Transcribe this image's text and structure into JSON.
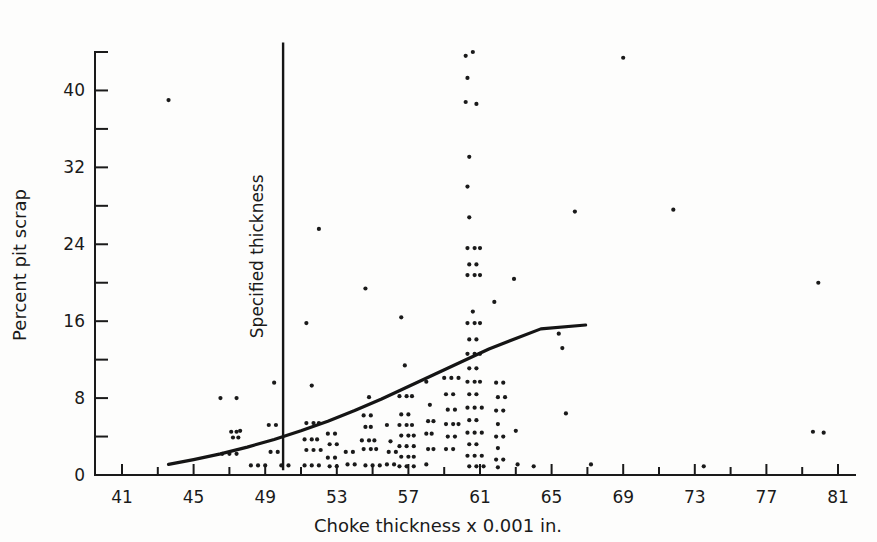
{
  "chart_data": {
    "type": "scatter",
    "title": "",
    "xlabel": "Choke thickness x 0.001 in.",
    "ylabel": "Percent pit scrap",
    "xlim": [
      40,
      82
    ],
    "ylim": [
      0,
      44
    ],
    "grid": false,
    "legend": null,
    "x_ticks_major": [
      41,
      45,
      49,
      53,
      57,
      61,
      65,
      69,
      73,
      77,
      81
    ],
    "x_ticks_minor": [
      43,
      47,
      51,
      55,
      59,
      63,
      67,
      71,
      75,
      79
    ],
    "y_ticks_major": [
      0,
      8,
      16,
      24,
      32,
      40
    ],
    "y_ticks_minor": [
      4,
      12,
      20,
      28,
      36,
      44
    ],
    "annotations": [
      {
        "text": "Specified thickness",
        "type": "vertical-reference-line",
        "x": 50.0,
        "y_from": 0.5,
        "y_to": 45.0,
        "label_x": 49.3,
        "label_rotation": -90
      }
    ],
    "series": [
      {
        "name": "Observations",
        "type": "scatter",
        "marker": "dot",
        "marker_size": 2.1,
        "color": "#1a1a1a",
        "points": [
          [
            43.6,
            39.0
          ],
          [
            46.5,
            8.0
          ],
          [
            47.4,
            8.0
          ],
          [
            47.1,
            4.5
          ],
          [
            47.4,
            4.5
          ],
          [
            47.6,
            4.6
          ],
          [
            47.2,
            3.9
          ],
          [
            47.5,
            3.9
          ],
          [
            46.6,
            2.2
          ],
          [
            47.0,
            2.2
          ],
          [
            47.4,
            2.2
          ],
          [
            48.2,
            1.0
          ],
          [
            48.6,
            1.0
          ],
          [
            49.0,
            1.0
          ],
          [
            49.5,
            9.6
          ],
          [
            49.2,
            5.2
          ],
          [
            49.6,
            5.2
          ],
          [
            49.3,
            2.4
          ],
          [
            49.7,
            2.4
          ],
          [
            49.9,
            1.0
          ],
          [
            50.3,
            1.0
          ],
          [
            51.3,
            15.8
          ],
          [
            52.0,
            25.6
          ],
          [
            51.6,
            9.3
          ],
          [
            51.3,
            5.4
          ],
          [
            51.7,
            5.4
          ],
          [
            52.0,
            5.4
          ],
          [
            51.2,
            3.7
          ],
          [
            51.6,
            3.7
          ],
          [
            51.9,
            3.7
          ],
          [
            51.3,
            2.6
          ],
          [
            51.7,
            2.6
          ],
          [
            52.1,
            2.6
          ],
          [
            51.2,
            1.0
          ],
          [
            51.6,
            1.0
          ],
          [
            52.0,
            1.0
          ],
          [
            52.5,
            4.3
          ],
          [
            52.9,
            4.3
          ],
          [
            52.6,
            3.2
          ],
          [
            53.0,
            3.2
          ],
          [
            52.5,
            1.8
          ],
          [
            52.9,
            1.8
          ],
          [
            52.6,
            0.9
          ],
          [
            53.0,
            0.9
          ],
          [
            53.5,
            2.4
          ],
          [
            53.9,
            2.4
          ],
          [
            53.6,
            1.1
          ],
          [
            54.0,
            1.1
          ],
          [
            54.6,
            19.4
          ],
          [
            54.8,
            8.1
          ],
          [
            54.5,
            6.2
          ],
          [
            54.9,
            6.2
          ],
          [
            54.6,
            5.0
          ],
          [
            54.9,
            5.0
          ],
          [
            54.4,
            3.6
          ],
          [
            54.8,
            3.6
          ],
          [
            55.1,
            3.6
          ],
          [
            54.5,
            2.7
          ],
          [
            54.9,
            2.7
          ],
          [
            55.2,
            2.7
          ],
          [
            54.6,
            1.0
          ],
          [
            55.0,
            1.0
          ],
          [
            55.4,
            1.0
          ],
          [
            55.8,
            5.2
          ],
          [
            56.0,
            3.5
          ],
          [
            55.9,
            2.4
          ],
          [
            56.3,
            2.4
          ],
          [
            55.8,
            1.1
          ],
          [
            56.2,
            1.1
          ],
          [
            56.6,
            16.4
          ],
          [
            56.8,
            11.4
          ],
          [
            56.5,
            8.2
          ],
          [
            56.9,
            8.2
          ],
          [
            57.2,
            8.2
          ],
          [
            56.6,
            6.3
          ],
          [
            57.0,
            6.3
          ],
          [
            56.5,
            5.2
          ],
          [
            56.9,
            5.2
          ],
          [
            57.2,
            5.2
          ],
          [
            56.6,
            4.1
          ],
          [
            57.0,
            4.1
          ],
          [
            57.3,
            4.1
          ],
          [
            56.5,
            3.0
          ],
          [
            56.9,
            3.0
          ],
          [
            57.3,
            3.0
          ],
          [
            56.6,
            1.9
          ],
          [
            57.0,
            1.9
          ],
          [
            57.3,
            1.9
          ],
          [
            56.5,
            0.9
          ],
          [
            56.9,
            0.9
          ],
          [
            57.3,
            0.9
          ],
          [
            58.0,
            9.7
          ],
          [
            58.2,
            7.3
          ],
          [
            58.1,
            5.6
          ],
          [
            58.4,
            5.6
          ],
          [
            58.0,
            4.3
          ],
          [
            58.3,
            4.3
          ],
          [
            58.1,
            2.7
          ],
          [
            58.4,
            2.7
          ],
          [
            58.0,
            1.1
          ],
          [
            59.0,
            10.1
          ],
          [
            59.4,
            10.1
          ],
          [
            59.8,
            10.1
          ],
          [
            59.1,
            8.4
          ],
          [
            59.5,
            8.4
          ],
          [
            59.2,
            6.8
          ],
          [
            59.6,
            6.8
          ],
          [
            59.1,
            5.3
          ],
          [
            59.5,
            5.3
          ],
          [
            59.8,
            5.3
          ],
          [
            59.2,
            4.0
          ],
          [
            59.6,
            4.0
          ],
          [
            59.1,
            2.7
          ],
          [
            59.5,
            2.7
          ],
          [
            60.2,
            43.6
          ],
          [
            60.6,
            44.0
          ],
          [
            60.3,
            41.3
          ],
          [
            60.2,
            38.8
          ],
          [
            60.8,
            38.6
          ],
          [
            60.4,
            33.1
          ],
          [
            60.3,
            30.0
          ],
          [
            60.4,
            26.8
          ],
          [
            60.3,
            23.6
          ],
          [
            60.7,
            23.6
          ],
          [
            61.0,
            23.6
          ],
          [
            60.4,
            21.9
          ],
          [
            60.8,
            21.9
          ],
          [
            60.3,
            20.8
          ],
          [
            60.7,
            20.8
          ],
          [
            61.0,
            20.8
          ],
          [
            60.6,
            17.0
          ],
          [
            60.3,
            15.8
          ],
          [
            60.7,
            15.8
          ],
          [
            61.0,
            15.8
          ],
          [
            60.4,
            14.1
          ],
          [
            60.8,
            14.1
          ],
          [
            60.3,
            12.6
          ],
          [
            60.7,
            12.6
          ],
          [
            61.0,
            12.6
          ],
          [
            60.4,
            11.1
          ],
          [
            60.8,
            11.1
          ],
          [
            60.3,
            9.7
          ],
          [
            60.7,
            9.7
          ],
          [
            61.0,
            9.7
          ],
          [
            60.4,
            8.4
          ],
          [
            60.8,
            8.4
          ],
          [
            60.3,
            7.0
          ],
          [
            60.7,
            7.0
          ],
          [
            61.1,
            7.0
          ],
          [
            60.4,
            5.7
          ],
          [
            60.8,
            5.7
          ],
          [
            60.3,
            4.4
          ],
          [
            60.7,
            4.4
          ],
          [
            61.1,
            4.4
          ],
          [
            60.4,
            3.2
          ],
          [
            60.8,
            3.2
          ],
          [
            60.3,
            2.0
          ],
          [
            60.7,
            2.0
          ],
          [
            61.1,
            2.0
          ],
          [
            60.4,
            0.9
          ],
          [
            60.8,
            0.9
          ],
          [
            61.2,
            0.9
          ],
          [
            61.8,
            18.0
          ],
          [
            61.9,
            9.6
          ],
          [
            62.3,
            9.6
          ],
          [
            62.0,
            8.1
          ],
          [
            62.4,
            8.1
          ],
          [
            61.9,
            6.7
          ],
          [
            62.3,
            6.7
          ],
          [
            62.0,
            5.3
          ],
          [
            61.9,
            4.0
          ],
          [
            62.3,
            4.0
          ],
          [
            62.0,
            2.8
          ],
          [
            61.9,
            1.6
          ],
          [
            62.3,
            1.6
          ],
          [
            62.0,
            0.8
          ],
          [
            62.9,
            20.4
          ],
          [
            63.0,
            4.6
          ],
          [
            63.1,
            1.1
          ],
          [
            64.0,
            0.9
          ],
          [
            65.4,
            14.7
          ],
          [
            65.6,
            13.2
          ],
          [
            65.8,
            6.4
          ],
          [
            66.3,
            27.4
          ],
          [
            67.2,
            1.1
          ],
          [
            69.0,
            43.4
          ],
          [
            71.8,
            27.6
          ],
          [
            79.9,
            20.0
          ],
          [
            79.6,
            4.5
          ],
          [
            80.2,
            4.4
          ],
          [
            73.5,
            0.9
          ]
        ]
      },
      {
        "name": "Fitted curve",
        "type": "line",
        "color": "#151515",
        "points": [
          [
            43.6,
            1.1
          ],
          [
            45.0,
            1.6
          ],
          [
            46.5,
            2.2
          ],
          [
            48.0,
            2.9
          ],
          [
            49.5,
            3.7
          ],
          [
            51.0,
            4.6
          ],
          [
            52.5,
            5.6
          ],
          [
            54.0,
            6.7
          ],
          [
            55.5,
            7.9
          ],
          [
            57.0,
            9.2
          ],
          [
            58.5,
            10.5
          ],
          [
            60.0,
            11.8
          ],
          [
            61.5,
            13.1
          ],
          [
            63.0,
            14.2
          ],
          [
            64.4,
            15.2
          ],
          [
            66.9,
            15.6
          ]
        ]
      }
    ]
  },
  "axis_titles": {
    "x": "Choke thickness x 0.001 in.",
    "y": "Percent pit scrap"
  },
  "annotation_text": {
    "specified_thickness": "Specified thickness"
  }
}
